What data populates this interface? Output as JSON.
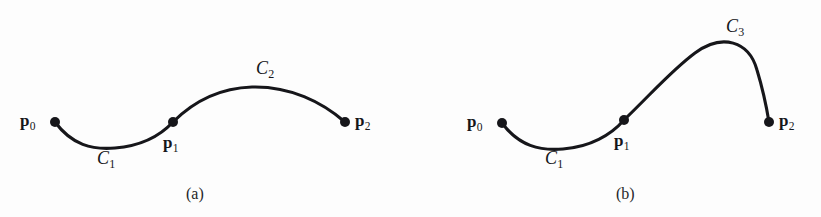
{
  "figure": {
    "background_color": "#fdfdfd",
    "ink_color": "#16161a",
    "stroke_width": 3.1,
    "point_radius": 5.0
  },
  "panels": [
    {
      "id": "panel-a",
      "caption": "(a)",
      "points": [
        {
          "name": "p0",
          "base": "p",
          "sub": "0",
          "x": 55,
          "y": 122,
          "label_x": 20,
          "label_y": 112,
          "label_align": "left"
        },
        {
          "name": "p1",
          "base": "p",
          "sub": "1",
          "x": 173,
          "y": 122,
          "label_x": 163,
          "label_y": 134,
          "label_align": "left"
        },
        {
          "name": "p2",
          "base": "p",
          "sub": "2",
          "x": 345,
          "y": 122,
          "label_x": 355,
          "label_y": 112,
          "label_align": "left"
        }
      ],
      "curve_labels": [
        {
          "name": "C1",
          "base": "C",
          "sub": "1",
          "x": 97,
          "y": 149
        },
        {
          "name": "C2",
          "base": "C",
          "sub": "2",
          "x": 256,
          "y": 59
        }
      ],
      "segments": [
        {
          "name": "C1",
          "path": "M 55,122 C 72,145 92,150 115,148 C 140,146 160,136 173,122"
        },
        {
          "name": "C2",
          "path": "M 173,122 C 196,99 222,88 252,87 C 290,86 322,102 345,122"
        }
      ]
    },
    {
      "id": "panel-b",
      "caption": "(b)",
      "points": [
        {
          "name": "p0",
          "base": "p",
          "sub": "0",
          "x": 502,
          "y": 123,
          "label_x": 467,
          "label_y": 113,
          "label_align": "left"
        },
        {
          "name": "p1",
          "base": "p",
          "sub": "1",
          "x": 624,
          "y": 120,
          "label_x": 614,
          "label_y": 132,
          "label_align": "left"
        },
        {
          "name": "p2",
          "base": "p",
          "sub": "2",
          "x": 769,
          "y": 122,
          "label_x": 779,
          "label_y": 112,
          "label_align": "left"
        }
      ],
      "curve_labels": [
        {
          "name": "C1",
          "base": "C",
          "sub": "1",
          "x": 545,
          "y": 149
        },
        {
          "name": "C3",
          "base": "C",
          "sub": "3",
          "x": 726,
          "y": 17
        }
      ],
      "segments": [
        {
          "name": "C1",
          "path": "M 502,123 C 519,146 540,151 563,149 C 590,147 611,135 624,120"
        },
        {
          "name": "C3",
          "path": "M 624,120 C 653,92 672,70 695,53 C 722,33 749,41 757,70 C 764,93 767,110 769,122"
        }
      ]
    }
  ],
  "text": {
    "caption_a": "(a)",
    "caption_b": "(b)",
    "p0": "p",
    "p1": "p",
    "p2": "p",
    "sub0": "0",
    "sub1": "1",
    "sub2": "2",
    "sub3": "3",
    "C": "C"
  }
}
